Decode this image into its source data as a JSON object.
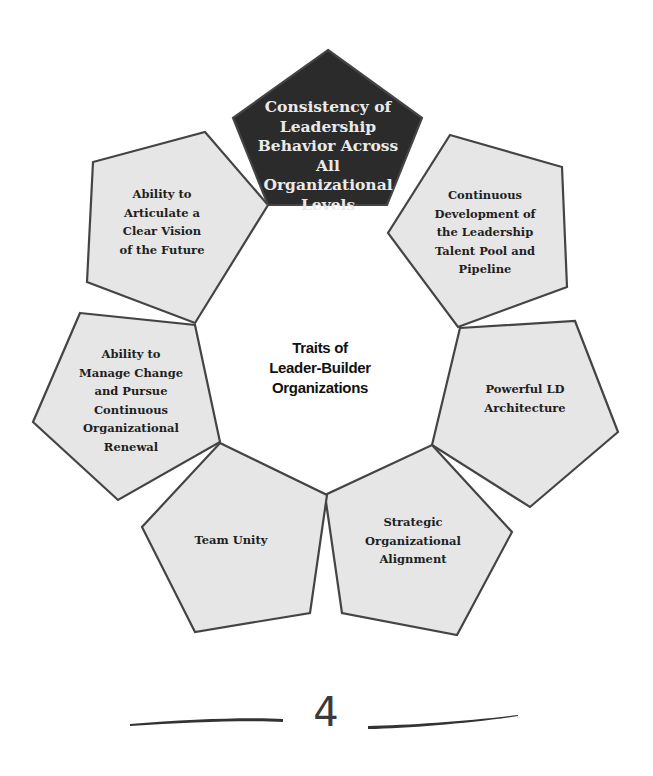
{
  "diagram": {
    "center_title": [
      "Traits of",
      "Leader-Builder",
      "Organizations"
    ],
    "colors": {
      "highlight_fill": "#2b2b2b",
      "normal_fill": "#e6e6e6",
      "stroke": "#444444",
      "highlight_text": "#eaeaea",
      "normal_text": "#1f1f1f"
    },
    "pentagons": [
      {
        "id": "consistency",
        "highlighted": true,
        "lines": [
          "Consistency of",
          "Leadership",
          "Behavior Across",
          "All",
          "Organizational",
          "Levels"
        ],
        "points": "328,50 422,118 387,205 268,205 233,118",
        "label_pos": [
          328,
          155
        ]
      },
      {
        "id": "continuous-development",
        "highlighted": false,
        "lines": [
          "Continuous",
          "Development of",
          "the Leadership",
          "Talent Pool and",
          "Pipeline"
        ],
        "points": "450,135 562,167 567,287 458,327 388,233",
        "label_pos": [
          485,
          232
        ]
      },
      {
        "id": "powerful-ld",
        "highlighted": false,
        "lines": [
          "Powerful LD",
          "Architecture"
        ],
        "points": "460,328 575,321 618,432 530,507 432,445",
        "label_pos": [
          525,
          398
        ]
      },
      {
        "id": "strategic-alignment",
        "highlighted": false,
        "lines": [
          "Strategic",
          "Organizational",
          "Alignment"
        ],
        "points": "432,445 512,532 457,635 342,613 325,495",
        "label_pos": [
          413,
          541
        ]
      },
      {
        "id": "team-unity",
        "highlighted": false,
        "lines": [
          "Team Unity"
        ],
        "points": "220,443 327,495 310,613 195,632 142,527",
        "label_pos": [
          231,
          540
        ]
      },
      {
        "id": "manage-change",
        "highlighted": false,
        "lines": [
          "Ability to",
          "Manage Change",
          "and Pursue",
          "Continuous",
          "Organizational",
          "Renewal"
        ],
        "points": "80,313 195,325 220,442 118,500 33,422",
        "label_pos": [
          131,
          400
        ]
      },
      {
        "id": "articulate-vision",
        "highlighted": false,
        "lines": [
          "Ability to",
          "Articulate a",
          "Clear Vision",
          "of the Future"
        ],
        "points": "205,132 268,205 195,323 87,282 93,162",
        "label_pos": [
          162,
          222
        ]
      }
    ]
  },
  "footer": {
    "page_number": "4"
  }
}
